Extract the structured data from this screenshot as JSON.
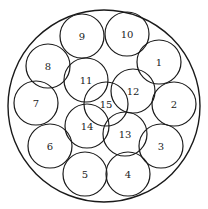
{
  "diagram": {
    "outer": {
      "cx": 104,
      "cy": 106,
      "r": 96
    },
    "circle_radius": 22,
    "circles": [
      {
        "label": "1",
        "cx": 159,
        "cy": 62
      },
      {
        "label": "2",
        "cx": 174,
        "cy": 104
      },
      {
        "label": "3",
        "cx": 161,
        "cy": 146
      },
      {
        "label": "4",
        "cx": 128,
        "cy": 174
      },
      {
        "label": "5",
        "cx": 85,
        "cy": 174
      },
      {
        "label": "6",
        "cx": 50,
        "cy": 146
      },
      {
        "label": "7",
        "cx": 36,
        "cy": 103
      },
      {
        "label": "8",
        "cx": 48,
        "cy": 66
      },
      {
        "label": "9",
        "cx": 82,
        "cy": 36
      },
      {
        "label": "10",
        "cx": 127,
        "cy": 34
      },
      {
        "label": "11",
        "cx": 86,
        "cy": 80
      },
      {
        "label": "12",
        "cx": 133,
        "cy": 91
      },
      {
        "label": "13",
        "cx": 125,
        "cy": 134
      },
      {
        "label": "14",
        "cx": 87,
        "cy": 126
      },
      {
        "label": "15",
        "cx": 106,
        "cy": 104
      }
    ]
  }
}
